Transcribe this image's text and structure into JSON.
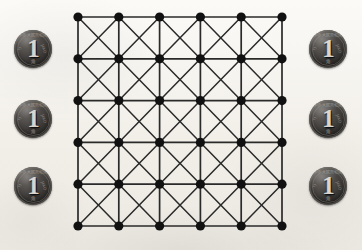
{
  "scene": {
    "width": 362,
    "height": 250,
    "background_color": "#f4f2ee",
    "description": "Square lattice diagram flanked by coins"
  },
  "lattice": {
    "name": "square-lattice-with-diagonals",
    "rows": 6,
    "columns": 6,
    "node_count": 36,
    "node_color": "#111111",
    "node_radius": 4.6,
    "edge_color": "#2a2a2a",
    "edge_width": 1.7,
    "diagonal_edge_width": 1.5,
    "origin_x": 78,
    "origin_y": 17,
    "spacing_x": 40.8,
    "spacing_y": 41.8,
    "edge_types": [
      "horizontal",
      "vertical",
      "diagonal-down",
      "diagonal-up"
    ]
  },
  "coins": {
    "count": 6,
    "denomination": "1",
    "legend_top": "中华人民共和国",
    "legend_bottom": "角",
    "legend_left": "YI",
    "legend_right": "JIAO",
    "body_color": "#2e2c2a",
    "numeral_color": "#d8d4cd",
    "diameter": 38,
    "left_column": [
      {
        "label": "coin-left-1",
        "x": 14,
        "y": 30
      },
      {
        "label": "coin-left-2",
        "x": 14,
        "y": 100
      },
      {
        "label": "coin-left-3",
        "x": 14,
        "y": 167
      }
    ],
    "right_column": [
      {
        "label": "coin-right-1",
        "x": 309,
        "y": 30
      },
      {
        "label": "coin-right-2",
        "x": 309,
        "y": 100
      },
      {
        "label": "coin-right-3",
        "x": 309,
        "y": 167
      }
    ]
  }
}
